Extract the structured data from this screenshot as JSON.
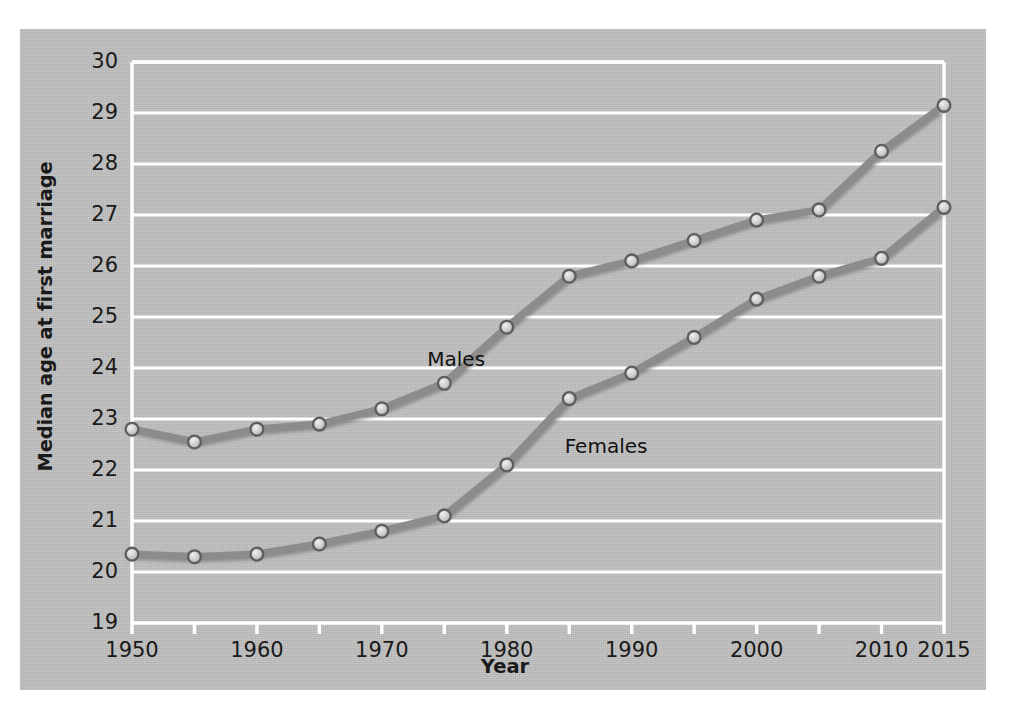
{
  "chart_data": {
    "type": "line",
    "title": "",
    "xlabel": "Year",
    "ylabel": "Median age at first marriage",
    "x": [
      1950,
      1955,
      1960,
      1965,
      1970,
      1975,
      1980,
      1985,
      1990,
      1995,
      2000,
      2005,
      2010,
      2015
    ],
    "xlim": [
      1950,
      2015
    ],
    "ylim": [
      19,
      30
    ],
    "xticks": [
      1950,
      1955,
      1960,
      1965,
      1970,
      1975,
      1980,
      1985,
      1990,
      1995,
      2000,
      2005,
      2010,
      2015
    ],
    "xticklabels": [
      "1950",
      "",
      "1960",
      "",
      "1970",
      "",
      "1980",
      "",
      "1990",
      "",
      "2000",
      "",
      "2010",
      "2015"
    ],
    "yticks": [
      19,
      20,
      21,
      22,
      23,
      24,
      25,
      26,
      27,
      28,
      29,
      30
    ],
    "yticklabels": [
      "19",
      "20",
      "21",
      "22",
      "23",
      "24",
      "25",
      "26",
      "27",
      "28",
      "29",
      "30"
    ],
    "grid": "horizontal white gridlines",
    "legend": "inline series labels on plot",
    "series": [
      {
        "name": "Males",
        "label_x": 1977,
        "label_y": 24.15,
        "values": [
          22.8,
          22.55,
          22.8,
          22.9,
          23.2,
          23.7,
          24.8,
          25.8,
          26.1,
          26.5,
          26.9,
          27.1,
          28.25,
          29.15
        ]
      },
      {
        "name": "Females",
        "label_x": 1988,
        "label_y": 22.45,
        "values": [
          20.35,
          20.3,
          20.35,
          20.55,
          20.8,
          21.1,
          22.1,
          23.4,
          23.9,
          24.6,
          25.35,
          25.8,
          26.15,
          27.15
        ]
      }
    ],
    "colors": {
      "panel_background": "#bfbfbf",
      "figure_background": "#ffffff",
      "gridline": "#ffffff",
      "axis": "#ffffff",
      "line": "#8c8c8c",
      "line_shadow": "#707070",
      "marker_edge": "#5e5e5e",
      "marker_face": "#cfcfcf",
      "text": "#1a1a1a"
    }
  }
}
